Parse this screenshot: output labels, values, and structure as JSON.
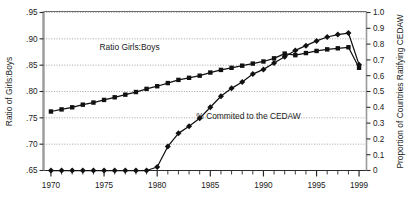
{
  "chart_data": {
    "type": "line",
    "title": "",
    "subtitle": "",
    "xlabel": "",
    "ylabel": "Ratio of Girls:Boys",
    "y2label": "Proportion of Countries Ratifying CEDAW",
    "x": [
      1970,
      1971,
      1972,
      1973,
      1974,
      1975,
      1976,
      1977,
      1978,
      1979,
      1980,
      1981,
      1982,
      1983,
      1984,
      1985,
      1986,
      1987,
      1988,
      1989,
      1990,
      1991,
      1992,
      1993,
      1994,
      1995,
      1996,
      1997,
      1998,
      1999
    ],
    "xlim": [
      1969.3,
      1999.7
    ],
    "xticks": [
      1970,
      1975,
      1980,
      1985,
      1990,
      1995,
      1999
    ],
    "xtick_labels": [
      "1970",
      "1975",
      "1980",
      "1985",
      "1990",
      "1995",
      "1999"
    ],
    "xminor_ticks_every": 1,
    "ylim": [
      0.65,
      0.95
    ],
    "yticks": [
      0.65,
      0.7,
      0.75,
      0.8,
      0.85,
      0.9,
      0.95
    ],
    "ytick_labels": [
      ".65",
      ".70",
      ".75",
      ".80",
      ".85",
      ".90",
      ".95"
    ],
    "y2lim": [
      0,
      1.0
    ],
    "y2ticks": [
      0,
      0.1,
      0.2,
      0.3,
      0.4,
      0.5,
      0.6,
      0.7,
      0.8,
      0.9,
      1.0
    ],
    "y2tick_labels": [
      "0",
      "0.1",
      "0.2",
      "0.3",
      "0.4",
      "0.5",
      "0.6",
      "0.7",
      "0.8",
      "0.9",
      "1.0"
    ],
    "grid": true,
    "grid_style": "dotted",
    "legend": "inline-annotations",
    "series": [
      {
        "name": "Ratio Girls:Boys",
        "axis": "left",
        "marker": "square",
        "color": "#111111",
        "label_x": 1977.4,
        "label_y": 0.885,
        "values": [
          0.762,
          0.766,
          0.77,
          0.775,
          0.779,
          0.784,
          0.789,
          0.794,
          0.799,
          0.805,
          0.81,
          0.816,
          0.822,
          0.826,
          0.83,
          0.836,
          0.841,
          0.845,
          0.849,
          0.853,
          0.857,
          0.863,
          0.872,
          0.869,
          0.873,
          0.877,
          0.88,
          0.882,
          0.884,
          0.845
        ]
      },
      {
        "name": "% Commited to the CEDAW",
        "axis": "right",
        "marker": "diamond",
        "color": "#111111",
        "label_x": 1988.6,
        "label_y": 0.345,
        "values": [
          0.0,
          0.0,
          0.0,
          0.0,
          0.0,
          0.0,
          0.0,
          0.0,
          0.0,
          0.0,
          0.022,
          0.152,
          0.235,
          0.28,
          0.33,
          0.4,
          0.47,
          0.52,
          0.56,
          0.61,
          0.64,
          0.68,
          0.72,
          0.76,
          0.79,
          0.82,
          0.845,
          0.86,
          0.87,
          0.67
        ]
      }
    ],
    "annotations": [
      {
        "text": "Ratio Girls:Boys",
        "x": 1977.4,
        "y_left": 0.885
      },
      {
        "text": "% Commited to the CEDAW",
        "x": 1988.6,
        "y_right": 0.345
      }
    ]
  }
}
